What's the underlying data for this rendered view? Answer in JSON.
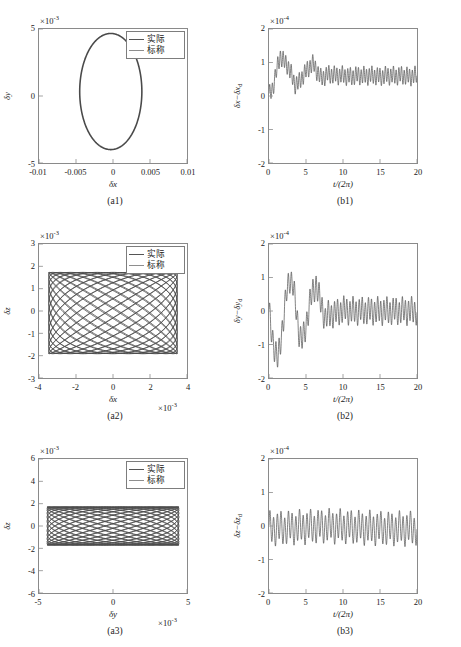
{
  "figure": {
    "legend": {
      "actual": "实际",
      "nominal": "标称"
    },
    "colors": {
      "actual": "#4a4a4a",
      "nominal": "#8e8e8e",
      "axis": "#8a8a8a",
      "text": "#1a1a1a"
    }
  },
  "panels": [
    {
      "id": "a1",
      "caption": "(a1)",
      "multiplier_y": "×10",
      "multiplier_y_exp": "-3",
      "multiplier_x": "",
      "xlabel": "δx",
      "ylabel": "δy",
      "ylabel_sub": "",
      "xticks": [
        "-0.01",
        "-0.005",
        "0",
        "0.005",
        "0.01"
      ],
      "yticks": [
        "5",
        "0",
        "-5"
      ],
      "has_legend": true
    },
    {
      "id": "b1",
      "caption": "(b1)",
      "multiplier_y": "×10",
      "multiplier_y_exp": "-4",
      "multiplier_x": "",
      "xlabel": "t/(2π)",
      "ylabel": "δx−δx",
      "ylabel_sub": "d",
      "xticks": [
        "0",
        "5",
        "10",
        "15",
        "20"
      ],
      "yticks": [
        "2",
        "1",
        "0",
        "-1",
        "-2"
      ],
      "has_legend": false
    },
    {
      "id": "a2",
      "caption": "(a2)",
      "multiplier_y": "×10",
      "multiplier_y_exp": "-3",
      "multiplier_x": "×10",
      "multiplier_x_exp": "-3",
      "xlabel": "δx",
      "ylabel": "δz",
      "ylabel_sub": "",
      "xticks": [
        "-4",
        "-2",
        "0",
        "2",
        "4"
      ],
      "yticks": [
        "3",
        "2",
        "1",
        "0",
        "-1",
        "-2",
        "-3"
      ],
      "has_legend": true
    },
    {
      "id": "b2",
      "caption": "(b2)",
      "multiplier_y": "×10",
      "multiplier_y_exp": "-4",
      "multiplier_x": "",
      "xlabel": "t/(2π)",
      "ylabel": "δy−δy",
      "ylabel_sub": "d",
      "xticks": [
        "0",
        "5",
        "10",
        "15",
        "20"
      ],
      "yticks": [
        "2",
        "1",
        "0",
        "-1",
        "-2"
      ],
      "has_legend": false
    },
    {
      "id": "a3",
      "caption": "(a3)",
      "multiplier_y": "×10",
      "multiplier_y_exp": "-3",
      "multiplier_x": "×10",
      "multiplier_x_exp": "-3",
      "xlabel": "δy",
      "ylabel": "δz",
      "ylabel_sub": "",
      "xticks": [
        "-5",
        "0",
        "5"
      ],
      "yticks": [
        "6",
        "4",
        "2",
        "0",
        "-2",
        "-4",
        "-6"
      ],
      "has_legend": true
    },
    {
      "id": "b3",
      "caption": "(b3)",
      "multiplier_y": "×10",
      "multiplier_y_exp": "-4",
      "multiplier_x": "",
      "xlabel": "t/(2π)",
      "ylabel": "δz−δz",
      "ylabel_sub": "d",
      "xticks": [
        "0",
        "5",
        "10",
        "15",
        "20"
      ],
      "yticks": [
        "2",
        "1",
        "0",
        "-1",
        "-2"
      ],
      "has_legend": false
    }
  ],
  "chart_data": [
    {
      "type": "line",
      "id": "a1",
      "title": "(a1)",
      "xlabel": "δx",
      "ylabel": "δy",
      "xlim": [
        -0.01,
        0.01
      ],
      "ylim": [
        -0.009,
        0.009
      ],
      "y_scale": 0.001,
      "grid": false,
      "legend": [
        "实际",
        "标称"
      ],
      "legend_position": "top-right",
      "description": "Closed elliptical orbit centred near origin",
      "series": [
        {
          "name": "实际",
          "shape": "ellipse",
          "center_x": -0.0003,
          "center_y": 0.0006,
          "semi_axis_x": 0.0042,
          "semi_axis_y": 0.0078,
          "tilt_deg": 0
        }
      ]
    },
    {
      "type": "line",
      "id": "b1",
      "title": "(b1)",
      "xlabel": "t/(2π)",
      "ylabel": "δx−δx_d",
      "xlim": [
        0,
        20
      ],
      "ylim": [
        -2.6,
        2.6
      ],
      "y_scale": 0.0001,
      "grid": false,
      "description": "Tracking error rises to a peak near t=1.7 then settles with persistent ripple around 0.8",
      "x": [
        0,
        0.5,
        1,
        1.5,
        2,
        2.5,
        3,
        3.5,
        4,
        4.5,
        5,
        5.5,
        6,
        6.5,
        7,
        7.5,
        8,
        9,
        10,
        11,
        12,
        13,
        14,
        15,
        16,
        17,
        18,
        19,
        20
      ],
      "values": [
        0.02,
        0.3,
        0.95,
        1.55,
        1.35,
        1.2,
        0.85,
        0.45,
        0.5,
        0.75,
        0.95,
        1.15,
        1.25,
        0.95,
        0.7,
        0.75,
        0.85,
        0.8,
        0.8,
        0.75,
        0.8,
        0.78,
        0.8,
        0.75,
        0.8,
        0.78,
        0.8,
        0.75,
        0.8
      ],
      "ripple_amplitude": 0.3,
      "ripple_cycles": 55
    },
    {
      "type": "line",
      "id": "a2",
      "title": "(a2)",
      "xlabel": "δx",
      "ylabel": "δz",
      "xlim": [
        -4.6,
        4.6
      ],
      "ylim": [
        -3.2,
        3.4
      ],
      "x_scale": 0.001,
      "y_scale": 0.001,
      "grid": false,
      "legend": [
        "实际",
        "标称"
      ],
      "legend_position": "top-right",
      "description": "Dense Lissajous weave filling rectangle x in [-4,4], z in [-2,2]",
      "series": [
        {
          "name": "实际",
          "shape": "lissajous",
          "amp_x": 4.0,
          "amp_y": 2.0,
          "freq_ratio": 1.0,
          "n_curves": 26,
          "phase_step_deg": 13.8
        }
      ]
    },
    {
      "type": "line",
      "id": "b2",
      "title": "(b2)",
      "xlabel": "t/(2π)",
      "ylabel": "δy−δy_d",
      "xlim": [
        0,
        20
      ],
      "ylim": [
        -2.6,
        2.6
      ],
      "y_scale": 0.0001,
      "grid": false,
      "description": "Error dips to -1.9 near t=1.2, peaks at 1.3 near t=2.8, then decays to steady ripple about 0",
      "x": [
        0,
        0.4,
        0.8,
        1.2,
        1.6,
        2,
        2.4,
        2.8,
        3.2,
        3.6,
        4,
        4.4,
        4.8,
        5.2,
        5.6,
        6,
        6.4,
        6.8,
        7.2,
        7.6,
        8,
        9,
        10,
        11,
        12,
        13,
        14,
        15,
        16,
        17,
        18,
        19,
        20
      ],
      "values": [
        -0.05,
        -0.95,
        -1.5,
        -1.9,
        -1.1,
        -0.2,
        0.75,
        1.25,
        1.1,
        0.2,
        -0.75,
        -1.15,
        -0.9,
        -0.2,
        0.45,
        0.8,
        1.05,
        0.5,
        0.1,
        -0.3,
        -0.15,
        -0.1,
        0.05,
        0.0,
        0.0,
        0.0,
        0.0,
        0.0,
        0.0,
        0.0,
        0.0,
        0.0,
        0.0
      ],
      "ripple_amplitude": 0.45,
      "ripple_cycles": 48
    },
    {
      "type": "line",
      "id": "a3",
      "title": "(a3)",
      "xlabel": "δy",
      "ylabel": "δz",
      "xlim": [
        -9,
        9
      ],
      "ylim": [
        -7,
        7
      ],
      "x_scale": 0.001,
      "y_scale": 0.001,
      "grid": false,
      "legend": [
        "实际",
        "标称"
      ],
      "legend_position": "top-right",
      "description": "Dense Lissajous band filling y in [-8,8], z in [-2,2]",
      "series": [
        {
          "name": "实际",
          "shape": "lissajous",
          "amp_x": 8.0,
          "amp_y": 2.0,
          "freq_ratio": 1.0,
          "n_curves": 26,
          "phase_step_deg": 13.8
        }
      ]
    },
    {
      "type": "line",
      "id": "b3",
      "title": "(b3)",
      "xlabel": "t/(2π)",
      "ylabel": "δz−δz_d",
      "xlim": [
        0,
        20
      ],
      "ylim": [
        -2.6,
        2.6
      ],
      "y_scale": 0.0001,
      "grid": false,
      "description": "Steady sinusoidal ripple between about -0.65 and 0.5 for the whole run",
      "x": [
        0,
        2,
        4,
        6,
        8,
        10,
        12,
        14,
        16,
        18,
        20
      ],
      "values": [
        -0.1,
        -0.08,
        -0.05,
        -0.02,
        0.0,
        -0.02,
        -0.05,
        -0.08,
        -0.1,
        -0.1,
        -0.1
      ],
      "ripple_amplitude": 0.55,
      "ripple_cycles": 40
    }
  ]
}
